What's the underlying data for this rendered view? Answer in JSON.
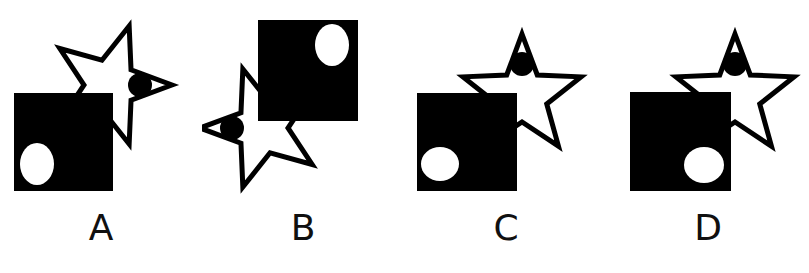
{
  "figure": {
    "background_color": "#ffffff",
    "ink_color": "#000000",
    "stroke_color": "#000000",
    "width": 809,
    "height": 273,
    "panel_count": 4
  },
  "panels": [
    {
      "id": "a",
      "label": "A",
      "square": {
        "fill": "#000000",
        "x": 14,
        "y": 93,
        "w": 99,
        "h": 98,
        "rotation": 0
      },
      "circle": {
        "fill": "#ffffff",
        "cx": 37,
        "cy": 164,
        "rx": 17,
        "ry": 21,
        "position": "lower-left-of-square"
      },
      "star": {
        "fill": "#ffffff",
        "stroke": "#000000",
        "stroke_width": 5,
        "cx": 110,
        "cy": 85,
        "outer_r": 62,
        "inner_r": 26,
        "rotation": 90,
        "orientation": "point-right"
      },
      "dot": {
        "fill": "#000000",
        "cx": 140,
        "cy": 85,
        "r": 12,
        "position": "on-right-star-point"
      },
      "z_order": [
        "star",
        "square",
        "circle",
        "dot"
      ]
    },
    {
      "id": "b",
      "label": "B",
      "square": {
        "fill": "#000000",
        "x": 258,
        "y": 20,
        "w": 100,
        "h": 101,
        "rotation": 0
      },
      "circle": {
        "fill": "#ffffff",
        "cx": 332,
        "cy": 45,
        "rx": 17,
        "ry": 21,
        "position": "upper-right-of-square"
      },
      "star": {
        "fill": "#ffffff",
        "stroke": "#000000",
        "stroke_width": 5,
        "cx": 262,
        "cy": 128,
        "outer_r": 62,
        "inner_r": 26,
        "rotation": -90,
        "orientation": "point-left"
      },
      "dot": {
        "fill": "#000000",
        "cx": 232,
        "cy": 128,
        "r": 12,
        "position": "on-left-star-point"
      },
      "z_order": [
        "star",
        "square",
        "circle",
        "dot"
      ]
    },
    {
      "id": "c",
      "label": "C",
      "square": {
        "fill": "#000000",
        "x": 417,
        "y": 93,
        "w": 100,
        "h": 98,
        "rotation": 0
      },
      "circle": {
        "fill": "#ffffff",
        "cx": 440,
        "cy": 164,
        "rx": 19,
        "ry": 17,
        "position": "lower-left-of-square"
      },
      "star": {
        "fill": "#ffffff",
        "stroke": "#000000",
        "stroke_width": 5,
        "cx": 522,
        "cy": 96,
        "outer_r": 62,
        "inner_r": 26,
        "rotation": 0,
        "orientation": "point-up"
      },
      "dot": {
        "fill": "#000000",
        "cx": 522,
        "cy": 64,
        "r": 12,
        "position": "on-top-star-point"
      },
      "z_order": [
        "star",
        "square",
        "circle",
        "dot"
      ]
    },
    {
      "id": "d",
      "label": "D",
      "square": {
        "fill": "#000000",
        "x": 630,
        "y": 92,
        "w": 101,
        "h": 99,
        "rotation": 0
      },
      "circle": {
        "fill": "#ffffff",
        "cx": 704,
        "cy": 165,
        "rx": 20,
        "ry": 18,
        "position": "lower-right-of-square"
      },
      "star": {
        "fill": "#ffffff",
        "stroke": "#000000",
        "stroke_width": 5,
        "cx": 735,
        "cy": 96,
        "outer_r": 62,
        "inner_r": 26,
        "rotation": 0,
        "orientation": "point-up"
      },
      "dot": {
        "fill": "#000000",
        "cx": 735,
        "cy": 64,
        "r": 12,
        "position": "on-top-star-point"
      },
      "z_order": [
        "star",
        "square",
        "circle",
        "dot"
      ]
    }
  ]
}
